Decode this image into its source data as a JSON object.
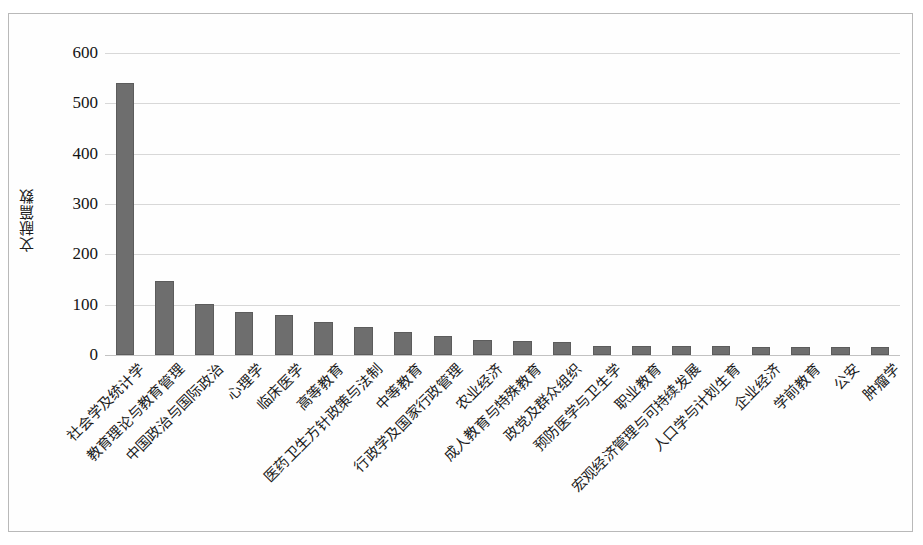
{
  "figure": {
    "background_color": "#ffffff",
    "frame_color": "#b9b9b9",
    "bar_color": "#6e6e6e",
    "bar_border_color": "#5c5c5c",
    "gridline_color": "#d8d8d8"
  },
  "chart_data": {
    "type": "bar",
    "title": "",
    "xlabel": "",
    "ylabel": "文献篇数",
    "ylim": [
      0,
      600
    ],
    "yticks": [
      0,
      100,
      200,
      300,
      400,
      500,
      600
    ],
    "ytick_labels": [
      "0",
      "100",
      "200",
      "300",
      "400",
      "500",
      "600"
    ],
    "grid": true,
    "legend": false,
    "categories": [
      "社会学及统计学",
      "教育理论与教育管理",
      "中国政治与国际政治",
      "心理学",
      "临床医学",
      "高等教育",
      "医药卫生方针政策与法制",
      "中等教育",
      "行政学及国家行政管理",
      "农业经济",
      "成人教育与特殊教育",
      "政党及群众组织",
      "预防医学与卫生学",
      "职业教育",
      "宏观经济管理与可持续发展",
      "人口学与计划生育",
      "企业经济",
      "学前教育",
      "公安",
      "肿瘤学"
    ],
    "values": [
      540,
      148,
      102,
      85,
      80,
      65,
      55,
      45,
      37,
      30,
      27,
      26,
      18,
      18,
      17,
      17,
      16,
      16,
      16,
      16
    ]
  }
}
